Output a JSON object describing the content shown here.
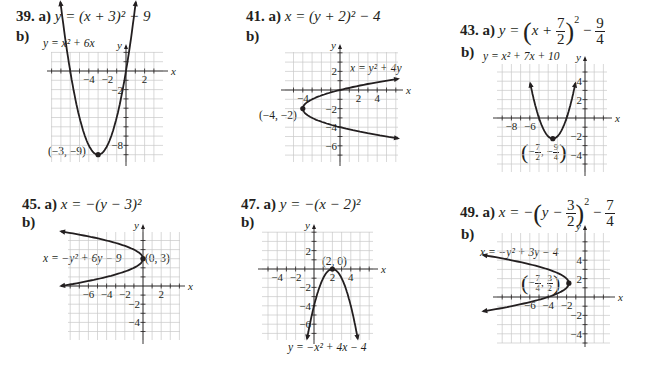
{
  "problems": [
    {
      "number": "39.",
      "part_a_label": "a)",
      "part_a_equation": "y = (x + 3)² − 9",
      "part_b_label": "b)",
      "graph_equation": "y = x² + 6x",
      "vertex_label": "(−3, −9)",
      "x_ticks": [
        "−4",
        "−2",
        "2"
      ],
      "y_ticks": [
        "−2",
        "−8"
      ],
      "axis_labels": {
        "x": "x",
        "y": "y"
      }
    },
    {
      "number": "41.",
      "part_a_label": "a)",
      "part_a_equation": "x = (y + 2)² − 4",
      "part_b_label": "b)",
      "graph_equation": "x = y² + 4y",
      "vertex_label": "(−4, −2)",
      "x_ticks": [
        "−4",
        "2",
        "4"
      ],
      "y_ticks": [
        "2",
        "−2",
        "−4",
        "−6"
      ],
      "axis_labels": {
        "x": "x",
        "y": "y"
      }
    },
    {
      "number": "43.",
      "part_a_label": "a)",
      "part_a_equation": {
        "lhs": "y =",
        "inner": "x +",
        "inner_frac": {
          "num": "7",
          "den": "2"
        },
        "exp": "2",
        "minus": "−",
        "const_frac": {
          "num": "9",
          "den": "4"
        }
      },
      "part_b_label": "b)",
      "graph_equation": "y = x²  + 7x + 10",
      "vertex_label": {
        "num1": "7",
        "den1": "2",
        "num2": "9",
        "den2": "4"
      },
      "x_ticks": [
        "−8",
        "−6"
      ],
      "y_ticks": [
        "4",
        "2",
        "−2",
        "−4"
      ],
      "axis_labels": {
        "x": "x",
        "y": "y"
      }
    },
    {
      "number": "45.",
      "part_a_label": "a)",
      "part_a_equation": "x = −(y − 3)²",
      "part_b_label": "b)",
      "graph_equation": "x = −y² + 6y − 9",
      "vertex_label": "(0, 3)",
      "x_ticks": [
        "−6",
        "−4",
        "−2",
        "2"
      ],
      "y_ticks": [
        "−2",
        "−4"
      ],
      "axis_labels": {
        "x": "x",
        "y": "y"
      }
    },
    {
      "number": "47.",
      "part_a_label": "a)",
      "part_a_equation": "y = −(x − 2)²",
      "part_b_label": "b)",
      "graph_equation": "y = −x²  + 4x − 4",
      "vertex_label": "(2, 0)",
      "x_ticks": [
        "−4",
        "−2",
        "2",
        "4"
      ],
      "y_ticks": [
        "2",
        "−2",
        "−4",
        "−6"
      ],
      "axis_labels": {
        "x": "x",
        "y": "y"
      }
    },
    {
      "number": "49.",
      "part_a_label": "a)",
      "part_a_equation": {
        "lhs": "x = −",
        "inner": "y −",
        "inner_frac": {
          "num": "3",
          "den": "2"
        },
        "exp": "2",
        "minus": "−",
        "const_frac": {
          "num": "7",
          "den": "4"
        }
      },
      "part_b_label": "b)",
      "graph_equation": "x = −y²  + 3y − 4",
      "vertex_label": {
        "num1": "7",
        "den1": "4",
        "num2": "3",
        "den2": "2"
      },
      "x_ticks": [
        "−6",
        "−4",
        "−2"
      ],
      "y_ticks": [
        "4",
        "2",
        "−2",
        "−4"
      ],
      "axis_labels": {
        "x": "x",
        "y": "y"
      }
    }
  ],
  "chart_data": [
    {
      "type": "line",
      "title": "39. y = x^2 + 6x",
      "vertex": [
        -3,
        -9
      ],
      "xlim": [
        -8,
        4
      ],
      "ylim": [
        -10,
        2
      ],
      "grid": true,
      "points": [
        [
          -7,
          7
        ],
        [
          -6,
          0
        ],
        [
          -5,
          -5
        ],
        [
          -4,
          -8
        ],
        [
          -3,
          -9
        ],
        [
          -2,
          -8
        ],
        [
          -1,
          -5
        ],
        [
          0,
          0
        ],
        [
          1,
          7
        ]
      ]
    },
    {
      "type": "line",
      "title": "41. x = y^2 + 4y",
      "vertex": [
        -4,
        -2
      ],
      "xlim": [
        -6,
        6
      ],
      "ylim": [
        -8,
        4
      ],
      "grid": true,
      "points": [
        [
          5,
          1
        ],
        [
          0,
          0
        ],
        [
          -3,
          -1
        ],
        [
          -4,
          -2
        ],
        [
          -3,
          -3
        ],
        [
          0,
          -4
        ],
        [
          5,
          -5
        ]
      ]
    },
    {
      "type": "line",
      "title": "43. y = x^2 + 7x + 10",
      "vertex": [
        -3.5,
        -2.25
      ],
      "xlim": [
        -10,
        2
      ],
      "ylim": [
        -6,
        6
      ],
      "grid": true,
      "points": [
        [
          -6,
          4
        ],
        [
          -5,
          0
        ],
        [
          -4,
          -2
        ],
        [
          -3.5,
          -2.25
        ],
        [
          -3,
          -2
        ],
        [
          -2,
          0
        ],
        [
          -1,
          4
        ]
      ]
    },
    {
      "type": "line",
      "title": "45. x = -y^2 + 6y - 9",
      "vertex": [
        0,
        3
      ],
      "xlim": [
        -8,
        4
      ],
      "ylim": [
        -6,
        6
      ],
      "grid": true,
      "points": [
        [
          -9,
          6
        ],
        [
          -4,
          5
        ],
        [
          -1,
          4
        ],
        [
          0,
          3
        ],
        [
          -1,
          2
        ],
        [
          -4,
          1
        ],
        [
          -9,
          0
        ]
      ]
    },
    {
      "type": "line",
      "title": "47. y = -x^2 + 4x - 4",
      "vertex": [
        2,
        0
      ],
      "xlim": [
        -6,
        6
      ],
      "ylim": [
        -8,
        4
      ],
      "grid": true,
      "points": [
        [
          -1,
          -9
        ],
        [
          0,
          -4
        ],
        [
          1,
          -1
        ],
        [
          2,
          0
        ],
        [
          3,
          -1
        ],
        [
          4,
          -4
        ],
        [
          5,
          -9
        ]
      ]
    },
    {
      "type": "line",
      "title": "49. x = -y^2 + 3y - 4",
      "vertex": [
        -1.75,
        1.5
      ],
      "xlim": [
        -8,
        4
      ],
      "ylim": [
        -6,
        6
      ],
      "grid": true,
      "points": [
        [
          -8,
          4.56
        ],
        [
          -4,
          3
        ],
        [
          -2,
          2
        ],
        [
          -1.75,
          1.5
        ],
        [
          -2,
          1
        ],
        [
          -4,
          0
        ],
        [
          -8,
          -1.56
        ]
      ]
    }
  ]
}
